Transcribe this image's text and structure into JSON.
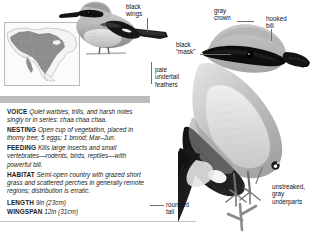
{
  "species": {
    "account_labels": {
      "voice": "VOICE",
      "nesting": "NESTING",
      "feeding": "FEEDING",
      "habitat": "HABITAT",
      "length": "LENGTH",
      "wingspan": "WINGSPAN"
    },
    "voice": "Quiet warbles, trills, and harsh notes singly or in series: chaa chaa chaa.",
    "nesting": "Open cup of vegetation, placed in thorny tree; 5 eggs; 1 brood; Mar–Jun.",
    "feeding": "Kills large insects and small vertebrates—rodents, birds, reptiles—with powerful bill.",
    "habitat": "Semi-open country with grazed short grass and scattered perches in generally remote regions; distribution is erratic.",
    "length": "9in (23cm)",
    "wingspan": "12in (31cm)"
  },
  "callouts": {
    "black_wings": "black\nwings",
    "gray_crown": "gray\ncrown",
    "hooked_bill": "hooked\nbill",
    "black_mask": "black\n“mask”",
    "pale_undertail": "pale\nundertail\nfeathers",
    "unstreaked_underparts": "unstreaked,\ngray\nunderparts",
    "rounded_tail": "rounded\ntail"
  },
  "badges": {
    "adult_symbol": "♂"
  },
  "range_map": {
    "name": "north-america-range-map",
    "range_color": "#7a7a7a",
    "land_color": "#f4f4f4",
    "border_color": "#9a9a9a"
  },
  "colors": {
    "band": "#bcbcbc",
    "plumage_gray": "#b6b6b6",
    "plumage_dark": "#141414",
    "plumage_white": "#f6f6f6",
    "leader": "#6e6e6e",
    "text": "#111111"
  },
  "illustrations": {
    "small_bird": "shrike-perched-side-view",
    "large_bird": "shrike-adult-perched-closeup"
  }
}
